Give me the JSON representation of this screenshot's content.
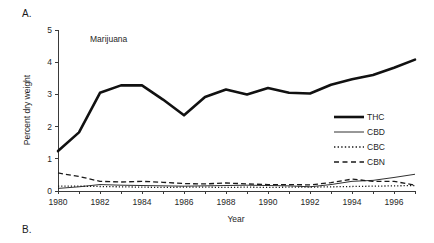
{
  "figure": {
    "panel_a_label": "A.",
    "panel_b_label": "B."
  },
  "chart_data": {
    "type": "line",
    "title": "Marijuana",
    "xlabel": "Year",
    "ylabel": "Percent dry weight",
    "xlim": [
      1980,
      1997
    ],
    "ylim": [
      0,
      5
    ],
    "xticks": [
      1980,
      1982,
      1984,
      1986,
      1988,
      1990,
      1992,
      1994,
      1996
    ],
    "xtick_labels": [
      "1980",
      "1982",
      "1984",
      "1986",
      "1988",
      "1990",
      "1992",
      "1994",
      "1996"
    ],
    "yticks": [
      0,
      1,
      2,
      3,
      4,
      5
    ],
    "ytick_labels": [
      "0",
      "1",
      "2",
      "3",
      "4",
      "5"
    ],
    "minor_xtick_interval": 1,
    "grid": false,
    "legend_position": "center-right",
    "x": [
      1980,
      1981,
      1982,
      1983,
      1984,
      1985,
      1986,
      1987,
      1988,
      1989,
      1990,
      1991,
      1992,
      1993,
      1994,
      1995,
      1996,
      1997
    ],
    "series": [
      {
        "name": "THC",
        "style": "solid-thick",
        "values": [
          1.24,
          1.82,
          3.05,
          3.28,
          3.28,
          2.84,
          2.35,
          2.92,
          3.15,
          3.0,
          3.2,
          3.05,
          3.03,
          3.3,
          3.47,
          3.6,
          3.83,
          4.08
        ]
      },
      {
        "name": "CBD",
        "style": "solid-thin",
        "values": [
          0.08,
          0.13,
          0.2,
          0.18,
          0.17,
          0.16,
          0.15,
          0.16,
          0.17,
          0.18,
          0.17,
          0.16,
          0.13,
          0.2,
          0.3,
          0.33,
          0.42,
          0.52
        ]
      },
      {
        "name": "CBC",
        "style": "dotted",
        "values": [
          0.15,
          0.15,
          0.14,
          0.13,
          0.12,
          0.11,
          0.12,
          0.12,
          0.11,
          0.12,
          0.11,
          0.12,
          0.12,
          0.13,
          0.14,
          0.15,
          0.16,
          0.17
        ]
      },
      {
        "name": "CBN",
        "style": "dashed",
        "values": [
          0.56,
          0.45,
          0.3,
          0.28,
          0.3,
          0.27,
          0.23,
          0.22,
          0.25,
          0.22,
          0.2,
          0.2,
          0.19,
          0.26,
          0.37,
          0.3,
          0.3,
          0.18
        ]
      }
    ],
    "legend": [
      {
        "label": "THC",
        "style": "solid-thick"
      },
      {
        "label": "CBD",
        "style": "solid-thin"
      },
      {
        "label": "CBC",
        "style": "dotted"
      },
      {
        "label": "CBN",
        "style": "dashed"
      }
    ]
  }
}
